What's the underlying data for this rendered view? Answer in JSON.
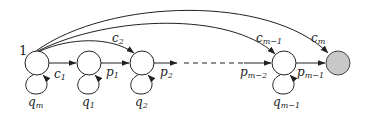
{
  "diagram": {
    "type": "markov-chain",
    "start_label": "1",
    "node_fill": "#ffffff",
    "final_node_fill": "#c8c8c8",
    "stroke": "#222222",
    "nodes": [
      {
        "id": "n0",
        "x": 37,
        "y": 63
      },
      {
        "id": "n1",
        "x": 89,
        "y": 63
      },
      {
        "id": "n2",
        "x": 142,
        "y": 63
      },
      {
        "id": "nm1",
        "x": 284,
        "y": 63
      },
      {
        "id": "final",
        "x": 338,
        "y": 63
      }
    ],
    "labels": {
      "c1": {
        "base": "c",
        "sub": "1"
      },
      "c2": {
        "base": "c",
        "sub": "2"
      },
      "cm1": {
        "base": "c",
        "sub": "m−1"
      },
      "cm": {
        "base": "c",
        "sub": "m"
      },
      "p1": {
        "base": "p",
        "sub": "1"
      },
      "p2": {
        "base": "p",
        "sub": "2"
      },
      "pm2": {
        "base": "p",
        "sub": "m−2"
      },
      "pm1": {
        "base": "p",
        "sub": "m−1"
      },
      "qm": {
        "base": "q",
        "sub": "m"
      },
      "q1": {
        "base": "q",
        "sub": "1"
      },
      "q2": {
        "base": "q",
        "sub": "2"
      },
      "qm1": {
        "base": "q",
        "sub": "m−1"
      }
    }
  }
}
